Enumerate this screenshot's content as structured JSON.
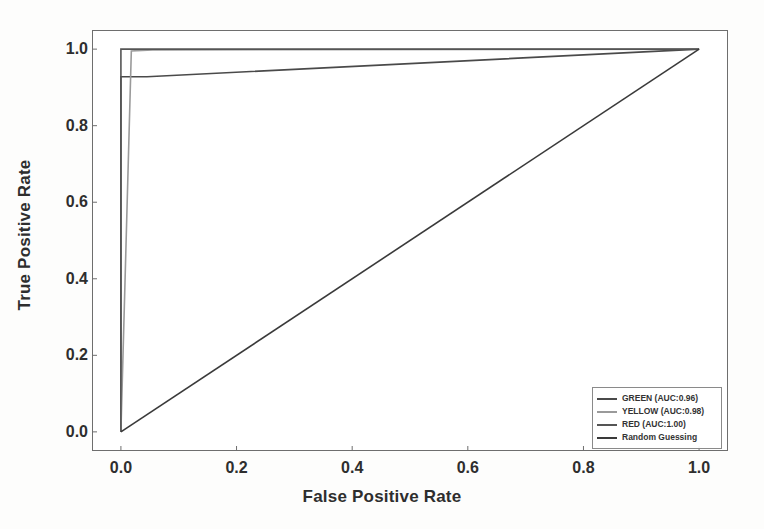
{
  "chart_data": {
    "type": "line",
    "title": "",
    "xlabel": "False Positive Rate",
    "ylabel": "True Positive Rate",
    "xlim": [
      -0.05,
      1.05
    ],
    "ylim": [
      -0.05,
      1.05
    ],
    "xticks": [
      "0.0",
      "0.2",
      "0.4",
      "0.6",
      "0.8",
      "1.0"
    ],
    "yticks": [
      "0.0",
      "0.2",
      "0.4",
      "0.6",
      "0.8",
      "1.0"
    ],
    "xtick_values": [
      0.0,
      0.2,
      0.4,
      0.6,
      0.8,
      1.0
    ],
    "ytick_values": [
      0.0,
      0.2,
      0.4,
      0.6,
      0.8,
      1.0
    ],
    "grid": false,
    "legend_position": "lower right",
    "series": [
      {
        "name": "GREEN (AUC:0.96)",
        "label": "GREEN (AUC:0.96)",
        "auc": 0.96,
        "color": "#4a4a4a",
        "x": [
          0.0,
          0.0,
          0.045,
          1.0
        ],
        "y": [
          0.0,
          0.928,
          0.928,
          1.0
        ]
      },
      {
        "name": "YELLOW (AUC:0.98)",
        "label": "YELLOW (AUC:0.98)",
        "auc": 0.98,
        "color": "#9a9a9a",
        "x": [
          0.0,
          0.018,
          0.055,
          1.0
        ],
        "y": [
          0.0,
          0.995,
          0.998,
          1.0
        ]
      },
      {
        "name": "RED (AUC:1.00)",
        "label": "RED (AUC:1.00)",
        "auc": 1.0,
        "color": "#555555",
        "x": [
          0.0,
          0.0,
          1.0
        ],
        "y": [
          0.0,
          1.0,
          1.0
        ]
      },
      {
        "name": "Random Guessing",
        "label": "Random Guessing",
        "auc": 0.5,
        "color": "#3a3a3a",
        "x": [
          0.0,
          1.0
        ],
        "y": [
          0.0,
          1.0
        ]
      }
    ]
  },
  "axes": {
    "xlabel": "False Positive Rate",
    "ylabel": "True Positive Rate"
  },
  "legend": {
    "items": [
      {
        "label": "GREEN (AUC:0.96)",
        "color": "#4a4a4a"
      },
      {
        "label": "YELLOW (AUC:0.98)",
        "color": "#9a9a9a"
      },
      {
        "label": "RED (AUC:1.00)",
        "color": "#555555"
      },
      {
        "label": "Random Guessing",
        "color": "#3a3a3a"
      }
    ]
  }
}
